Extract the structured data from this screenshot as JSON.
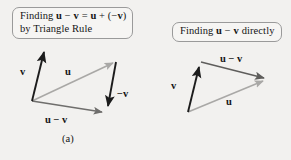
{
  "figure": {
    "background_color": "#f2f1ef",
    "width": 291,
    "height": 160
  },
  "panel_a": {
    "callout": {
      "line1_prefix": "Finding ",
      "line1_u1": "u",
      "line1_minus": " − ",
      "line1_v1": "v",
      "line1_eq": " = ",
      "line1_u2": "u",
      "line1_plus": " + (−",
      "line1_v2": "v",
      "line1_close": ")",
      "line2": "by Triangle Rule"
    },
    "labels": {
      "v": "v",
      "u": "u",
      "neg_v": "−v",
      "u_minus_v": "u − v"
    },
    "caption": "(a)",
    "vectors": [
      {
        "name": "v",
        "color": "#1c1c1c",
        "from": [
          32,
          101
        ],
        "to": [
          45,
          48
        ]
      },
      {
        "name": "u",
        "color": "#a9a8a6",
        "from": [
          32,
          101
        ],
        "to": [
          117,
          62
        ]
      },
      {
        "name": "neg-v",
        "color": "#1c1c1c",
        "from": [
          116,
          62
        ],
        "to": [
          107,
          110
        ]
      },
      {
        "name": "u-minus-v",
        "color": "#6f6e6c",
        "from": [
          32,
          101
        ],
        "to": [
          106,
          113
        ]
      }
    ]
  },
  "panel_b": {
    "callout": {
      "prefix": "Finding ",
      "u": "u",
      "minus": " − ",
      "v": "v",
      "suffix": " directly"
    },
    "labels": {
      "v": "v",
      "u": "u",
      "u_minus_v": "u − v"
    },
    "caption": "(b)",
    "vectors": [
      {
        "name": "v",
        "color": "#1c1c1c",
        "from": [
          188,
          112
        ],
        "to": [
          200,
          63
        ]
      },
      {
        "name": "u-minus-v",
        "color": "#5e5d5b",
        "from": [
          201,
          62
        ],
        "to": [
          268,
          79
        ]
      },
      {
        "name": "u",
        "color": "#a9a8a6",
        "from": [
          188,
          112
        ],
        "to": [
          268,
          79
        ]
      }
    ]
  },
  "colors": {
    "dark_vector": "#1c1c1c",
    "light_vector": "#a9a8a6",
    "mid_vector": "#6f6e6c",
    "callout_border": "#9a9a9a",
    "callout_fill": "#f6f5f3",
    "page_background": "#f2f1ef",
    "text": "#141414"
  }
}
